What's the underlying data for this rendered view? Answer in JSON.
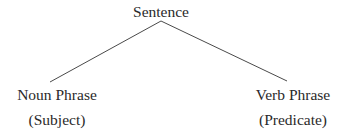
{
  "diagram": {
    "type": "tree",
    "root": {
      "label": "Sentence"
    },
    "children": [
      {
        "label": "Noun Phrase",
        "sublabel": "(Subject)"
      },
      {
        "label": "Verb Phrase",
        "sublabel": "(Predicate)"
      }
    ],
    "colors": {
      "text": "#2a2a2a",
      "edge": "#4a4a4a",
      "background": "#ffffff"
    }
  }
}
